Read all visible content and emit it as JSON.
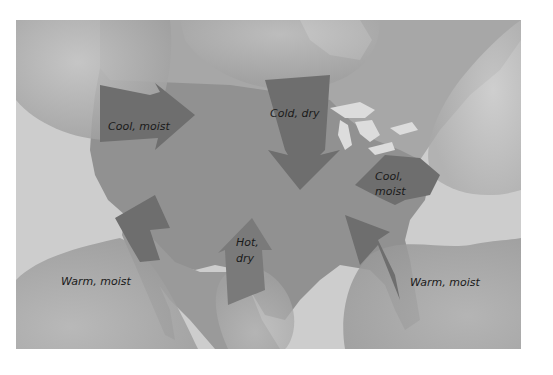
{
  "figure": {
    "type": "air-mass-map",
    "colors": {
      "background_sea": "#c9c9c9",
      "land": "#9b9b9b",
      "land_interior_us": "#8f8f8f",
      "air_mass_blob_light": "#b9b9b9",
      "air_mass_blob_dark": "#a3a3a3",
      "arrow_fill": "#6f6f6f",
      "lakes": "#dcdcdc",
      "text": "#1a1a1a"
    }
  },
  "air_masses": [
    {
      "id": "pacific-north",
      "label": "Cool, moist",
      "line1": "Cool, moist",
      "line2": "",
      "direction": "east"
    },
    {
      "id": "continental-polar",
      "label": "Cold, dry",
      "line1": "Cold, dry",
      "line2": "",
      "direction": "south"
    },
    {
      "id": "atlantic-north",
      "label": "Cool, moist",
      "line1": "Cool,",
      "line2": "moist",
      "direction": "southwest"
    },
    {
      "id": "pacific-south",
      "label": "Warm, moist",
      "line1": "Warm, moist",
      "line2": "",
      "direction": "northeast"
    },
    {
      "id": "continental-tropical",
      "label": "Hot, dry",
      "line1": "Hot,",
      "line2": "dry",
      "direction": "north"
    },
    {
      "id": "gulf-atlantic-south",
      "label": "Warm, moist",
      "line1": "Warm, moist",
      "line2": "",
      "direction": "northwest"
    }
  ]
}
